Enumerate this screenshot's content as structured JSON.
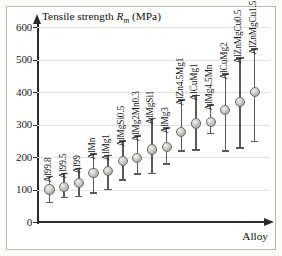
{
  "chart_data": {
    "type": "scatter",
    "title_parts": {
      "lead": "Tensile strength ",
      "symbol": "R",
      "subscript": "m",
      "units": " (MPa)"
    },
    "xlabel": "Alloy",
    "ylabel": "Tensile strength R_m (MPa)",
    "ylim": [
      0,
      600
    ],
    "ytick_values": [
      0,
      100,
      200,
      300,
      400,
      500,
      600
    ],
    "ytick_labels": [
      "0",
      "100",
      "200",
      "300",
      "400",
      "500",
      "600"
    ],
    "grid": true,
    "grid_axis": "y",
    "legend": "none",
    "error_bars": true,
    "categories": [
      "Al99.8",
      "Al99.5",
      "Al99",
      "AlMn",
      "AlMg1",
      "AlMgSi0.5",
      "AlMg2Mn0.3",
      "AlMgSi1",
      "AlMg3",
      "AlZn4.5Mg1",
      "AlCuMg1",
      "AlMg4.5Mn",
      "AlCuMg2",
      "AlZnMgCu0.5",
      "AlZnMgCu1.5"
    ],
    "values": [
      100,
      108,
      120,
      150,
      157,
      188,
      198,
      223,
      230,
      278,
      303,
      307,
      345,
      370,
      400
    ],
    "err_low": [
      60,
      75,
      78,
      90,
      100,
      130,
      148,
      150,
      178,
      218,
      222,
      272,
      218,
      228,
      248
    ],
    "err_high": [
      140,
      150,
      165,
      210,
      205,
      250,
      265,
      318,
      290,
      375,
      390,
      360,
      455,
      505,
      532
    ],
    "points": [
      {
        "category": "Al99.8",
        "value": 100,
        "low": 60,
        "high": 140
      },
      {
        "category": "Al99.5",
        "value": 108,
        "low": 75,
        "high": 150
      },
      {
        "category": "Al99",
        "value": 120,
        "low": 78,
        "high": 165
      },
      {
        "category": "AlMn",
        "value": 150,
        "low": 90,
        "high": 210
      },
      {
        "category": "AlMg1",
        "value": 157,
        "low": 100,
        "high": 205
      },
      {
        "category": "AlMgSi0.5",
        "value": 188,
        "low": 130,
        "high": 250
      },
      {
        "category": "AlMg2Mn0.3",
        "value": 198,
        "low": 148,
        "high": 265
      },
      {
        "category": "AlMgSi1",
        "value": 223,
        "low": 150,
        "high": 318
      },
      {
        "category": "AlMg3",
        "value": 230,
        "low": 178,
        "high": 290
      },
      {
        "category": "AlZn4.5Mg1",
        "value": 278,
        "low": 218,
        "high": 375
      },
      {
        "category": "AlCuMg1",
        "value": 303,
        "low": 222,
        "high": 390
      },
      {
        "category": "AlMg4.5Mn",
        "value": 307,
        "low": 272,
        "high": 360
      },
      {
        "category": "AlCuMg2",
        "value": 345,
        "low": 218,
        "high": 455
      },
      {
        "category": "AlZnMgCu0.5",
        "value": 370,
        "low": 228,
        "high": 505
      },
      {
        "category": "AlZnMgCu1.5",
        "value": 400,
        "low": 248,
        "high": 532
      }
    ],
    "colors": {
      "marker_fill": "#cfcfca",
      "marker_edge": "#6e6e68",
      "error_bar": "#5a5a5a",
      "axis": "#2b2b2b",
      "grid": "#e2e2e4",
      "frame": "#b9b6b0",
      "background": "#ffffff"
    }
  }
}
